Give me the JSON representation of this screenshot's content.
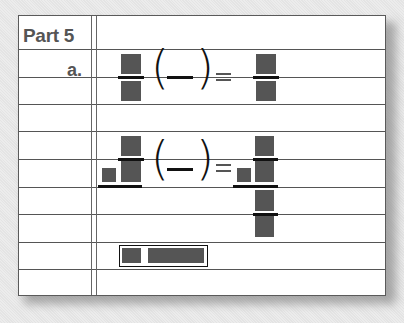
{
  "worksheet": {
    "title": "Part 5",
    "item_label": "a.",
    "colors": {
      "placeholder_box": "#555555",
      "rule_line": "#555555",
      "ink": "#111111"
    }
  }
}
